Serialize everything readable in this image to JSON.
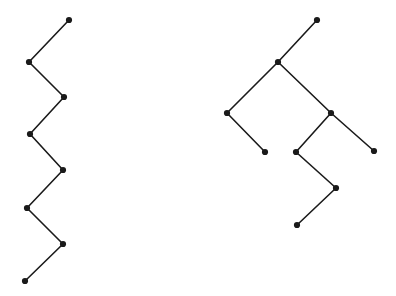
{
  "canvas": {
    "width": 396,
    "height": 296,
    "background_color": "#ffffff"
  },
  "style": {
    "node_color": "#1a1a1a",
    "edge_color": "#1a1a1a",
    "node_radius": 3.1,
    "edge_width": 1.6
  },
  "figures": [
    {
      "id": "left-figure",
      "name": "zigzag-path-graph",
      "node_count": 8,
      "edge_count": 7,
      "nodes": [
        {
          "id": "L1",
          "x": 69,
          "y": 20,
          "degree": 1
        },
        {
          "id": "L2",
          "x": 29,
          "y": 62,
          "degree": 2
        },
        {
          "id": "L3",
          "x": 64,
          "y": 97,
          "degree": 2
        },
        {
          "id": "L4",
          "x": 30,
          "y": 134,
          "degree": 2
        },
        {
          "id": "L5",
          "x": 63,
          "y": 170,
          "degree": 2
        },
        {
          "id": "L6",
          "x": 27,
          "y": 208,
          "degree": 2
        },
        {
          "id": "L7",
          "x": 63,
          "y": 244,
          "degree": 2
        },
        {
          "id": "L8",
          "x": 25,
          "y": 281,
          "degree": 1
        }
      ],
      "edges": [
        {
          "from": "L1",
          "to": "L2"
        },
        {
          "from": "L2",
          "to": "L3"
        },
        {
          "from": "L3",
          "to": "L4"
        },
        {
          "from": "L4",
          "to": "L5"
        },
        {
          "from": "L5",
          "to": "L6"
        },
        {
          "from": "L6",
          "to": "L7"
        },
        {
          "from": "L7",
          "to": "L8"
        }
      ]
    },
    {
      "id": "right-figure",
      "name": "branching-tree-graph",
      "node_count": 10,
      "edge_count": 9,
      "nodes": [
        {
          "id": "R1",
          "x": 317,
          "y": 20,
          "degree": 1
        },
        {
          "id": "R2",
          "x": 278,
          "y": 62,
          "degree": 3
        },
        {
          "id": "R3",
          "x": 227,
          "y": 113,
          "degree": 2
        },
        {
          "id": "R4",
          "x": 265,
          "y": 152,
          "degree": 1
        },
        {
          "id": "R5",
          "x": 331,
          "y": 113,
          "degree": 3
        },
        {
          "id": "R6",
          "x": 374,
          "y": 151,
          "degree": 1
        },
        {
          "id": "R7",
          "x": 296,
          "y": 152,
          "degree": 2
        },
        {
          "id": "R8",
          "x": 336,
          "y": 188,
          "degree": 2
        },
        {
          "id": "R9",
          "x": 297,
          "y": 225,
          "degree": 1
        }
      ],
      "edges": [
        {
          "from": "R1",
          "to": "R2"
        },
        {
          "from": "R2",
          "to": "R3"
        },
        {
          "from": "R3",
          "to": "R4"
        },
        {
          "from": "R2",
          "to": "R5"
        },
        {
          "from": "R5",
          "to": "R6"
        },
        {
          "from": "R5",
          "to": "R7"
        },
        {
          "from": "R7",
          "to": "R8"
        },
        {
          "from": "R8",
          "to": "R9"
        }
      ]
    }
  ]
}
